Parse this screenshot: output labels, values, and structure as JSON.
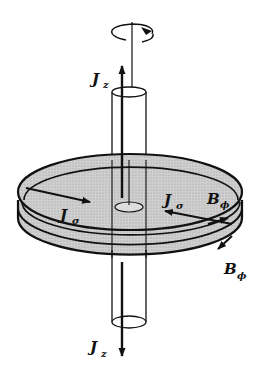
{
  "diagram": {
    "colors": {
      "stroke": "#111111",
      "disk_fill": "#c8c8c8",
      "background": "#ffffff"
    },
    "labels": {
      "jz_top": {
        "main": "J",
        "sub": "z"
      },
      "jz_bottom": {
        "main": "J",
        "sub": "z"
      },
      "jsigma_left": {
        "main": "J",
        "sub": "σ"
      },
      "jsigma_right": {
        "main": "J",
        "sub": "σ"
      },
      "bphi_upper": {
        "main": "B",
        "sub": "ϕ"
      },
      "bphi_lower": {
        "main": "B",
        "sub": "ϕ"
      }
    }
  }
}
